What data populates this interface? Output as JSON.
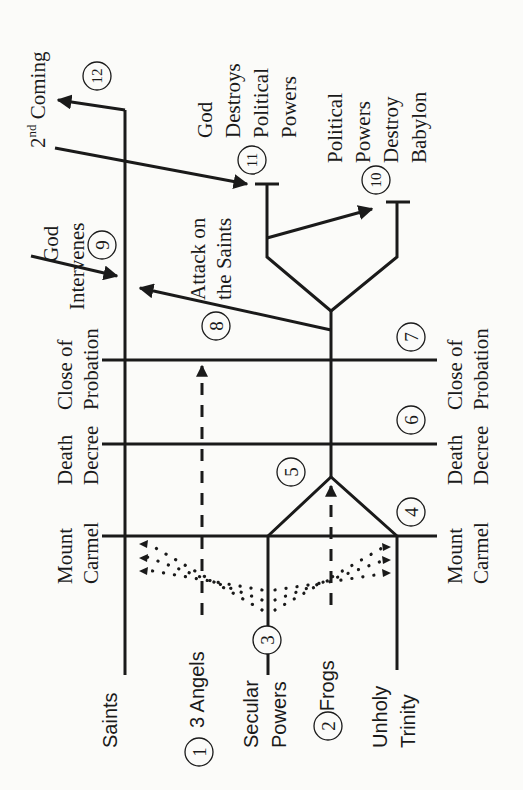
{
  "events_left": {
    "mount_carmel": [
      "Mount",
      "Carmel"
    ],
    "death_decree": [
      "Death",
      "Decree"
    ],
    "close_of_probation": [
      "Close of",
      "Probation"
    ]
  },
  "events_right": {
    "mount_carmel": [
      "Mount",
      "Carmel"
    ],
    "death_decree": [
      "Death",
      "Decree"
    ],
    "close_of_probation": [
      "Close of",
      "Probation"
    ]
  },
  "groups": {
    "saints": "Saints",
    "three_angels": "3 Angels",
    "secular_powers": [
      "Secular",
      "Powers"
    ],
    "three_frogs": "3 Frogs",
    "unholy_trinity": [
      "Unholy",
      "Trinity"
    ]
  },
  "top_labels": {
    "second_coming_prefix": "2",
    "second_coming_sup": "nd",
    "second_coming_suffix": " Coming",
    "god_intervenes": [
      "God",
      "Intervenes"
    ],
    "attack_on_saints": [
      "Attack on",
      "the Saints"
    ],
    "god_destroys": [
      "God",
      "Destroys",
      "Political",
      "Powers"
    ],
    "political_destroy": [
      "Political",
      "Powers",
      "Destroy",
      "Babylon"
    ]
  },
  "markers": [
    "1",
    "2",
    "3",
    "4",
    "5",
    "6",
    "7",
    "8",
    "9",
    "10",
    "11",
    "12"
  ]
}
